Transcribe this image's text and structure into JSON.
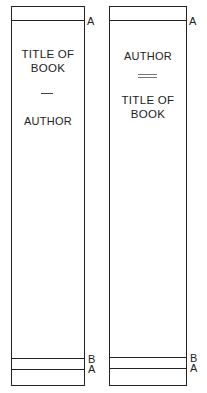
{
  "diagram": {
    "left_spine": {
      "title": "TITLE OF BOOK",
      "title_line1": "TITLE OF",
      "title_line2": "BOOK",
      "separator": "single-dash",
      "author": "AUTHOR",
      "order": [
        "title",
        "author"
      ]
    },
    "right_spine": {
      "author": "AUTHOR",
      "separator": "double-dash",
      "title": "TITLE OF BOOK",
      "title_line1": "TITLE OF",
      "title_line2": "BOOK",
      "order": [
        "author",
        "title"
      ]
    },
    "markers": {
      "top": "A",
      "bottom_upper": "B",
      "bottom_lower": "A"
    }
  }
}
